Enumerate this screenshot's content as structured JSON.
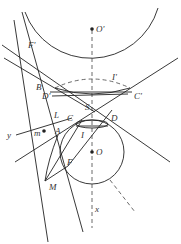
{
  "diagram": {
    "type": "geometry",
    "colors": {
      "stroke": "#222222",
      "background": "#ffffff"
    },
    "labels": {
      "O_prime": "O'",
      "O": "O",
      "F_prime": "F'",
      "F": "F",
      "B": "B",
      "D_prime": "D'",
      "C_prime": "C'",
      "I_prime": "I'",
      "S": "S",
      "C": "C",
      "D": "D",
      "L": "L",
      "y": "y",
      "m": "m",
      "A": "A",
      "I": "I",
      "M": "M",
      "x": "x"
    }
  }
}
